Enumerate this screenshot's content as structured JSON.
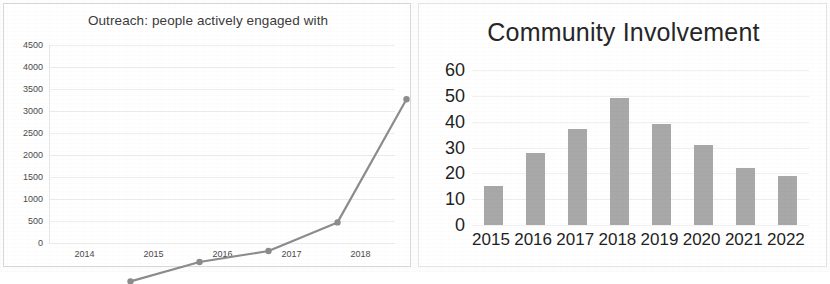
{
  "image": {
    "kind": "scanned-document-figure",
    "panels": 2
  },
  "left_panel": {
    "name": "outreach-line-chart",
    "title": "Outreach: people actively engaged with"
  },
  "right_panel": {
    "name": "community-involvement-bar-chart",
    "title": "Community Involvement"
  },
  "chart_data": [
    {
      "type": "line",
      "title": "Outreach: people actively engaged with",
      "xlabel": "",
      "ylabel": "",
      "categories": [
        "2014",
        "2015",
        "2016",
        "2017",
        "2018"
      ],
      "x": [
        2014,
        2015,
        2016,
        2017,
        2018
      ],
      "values": [
        60,
        500,
        750,
        1400,
        4200
      ],
      "series": [
        {
          "name": "People actively engaged with",
          "values": [
            60,
            500,
            750,
            1400,
            4200
          ]
        }
      ],
      "ylim": [
        0,
        4500
      ],
      "ytick_labels": [
        "0",
        "500",
        "1000",
        "1500",
        "2000",
        "2500",
        "3000",
        "3500",
        "4000",
        "4500"
      ],
      "ytick_values": [
        0,
        500,
        1000,
        1500,
        2000,
        2500,
        3000,
        3500,
        4000,
        4500
      ],
      "xtick_labels": [
        "2014",
        "2015",
        "2016",
        "2017",
        "2018"
      ],
      "grid": true,
      "legend": "none",
      "line_color": "#8c8c8c",
      "marker": "circle",
      "marker_color": "#8c8c8c"
    },
    {
      "type": "bar",
      "title": "Community Involvement",
      "xlabel": "",
      "ylabel": "",
      "categories": [
        "2015",
        "2016",
        "2017",
        "2018",
        "2019",
        "2020",
        "2021",
        "2022"
      ],
      "values": [
        15,
        28,
        37,
        49,
        39,
        31,
        22,
        19
      ],
      "series": [
        {
          "name": "Community Involvement",
          "values": [
            15,
            28,
            37,
            49,
            39,
            31,
            22,
            19
          ]
        }
      ],
      "ylim": [
        0,
        60
      ],
      "ytick_labels": [
        "0",
        "10",
        "20",
        "30",
        "40",
        "50",
        "60"
      ],
      "ytick_values": [
        0,
        10,
        20,
        30,
        40,
        50,
        60
      ],
      "xtick_labels": [
        "2015",
        "2016",
        "2017",
        "2018",
        "2019",
        "2020",
        "2021",
        "2022"
      ],
      "grid": true,
      "legend": "none",
      "bar_color": "#a8a8a8"
    }
  ]
}
